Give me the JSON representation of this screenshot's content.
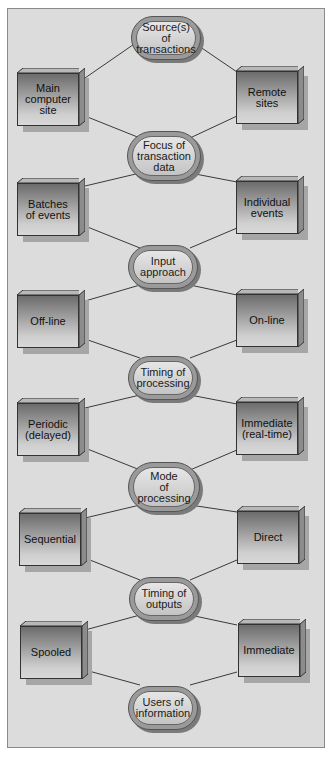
{
  "diagram": {
    "type": "decision-chain",
    "colors": {
      "background": "#dcdcdc",
      "border": "#8a8a8a",
      "box_dark": "#6c6c6c",
      "box_light": "#d8d8d8",
      "oval": "#c4c4c4"
    },
    "levels": [
      {
        "criterion": "Source(s) of\ntransactions",
        "left": "Main\ncomputer\nsite",
        "right": "Remote\nsites"
      },
      {
        "criterion": "Focus of\ntransaction\ndata",
        "left": "Batches\nof events",
        "right": "Individual\nevents"
      },
      {
        "criterion": "Input\napproach",
        "left": "Off-line",
        "right": "On-line"
      },
      {
        "criterion": "Timing of\nprocessing",
        "left": "Periodic\n(delayed)",
        "right": "Immediate\n(real-time)"
      },
      {
        "criterion": "Mode\nof\nprocessing",
        "left": "Sequential",
        "right": "Direct"
      },
      {
        "criterion": "Timing of\noutputs",
        "left": "Spooled",
        "right": "Immediate"
      },
      {
        "criterion": "Users of\ninformation"
      }
    ]
  }
}
